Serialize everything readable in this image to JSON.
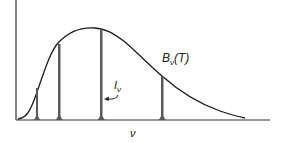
{
  "diagram": {
    "curve_label": {
      "main": "B",
      "sub": "ν",
      "rest": "(T)"
    },
    "line_label": {
      "main": "I",
      "sub": "ν"
    },
    "x_axis_label": "ν",
    "colors": {
      "curve": "#1a1a1a",
      "lines": "#5a5a5a",
      "axis": "#333333"
    },
    "emission_lines": [
      {
        "x": 37,
        "top": 88
      },
      {
        "x": 59,
        "top": 44
      },
      {
        "x": 101,
        "top": 29
      },
      {
        "x": 162,
        "top": 76
      }
    ]
  }
}
